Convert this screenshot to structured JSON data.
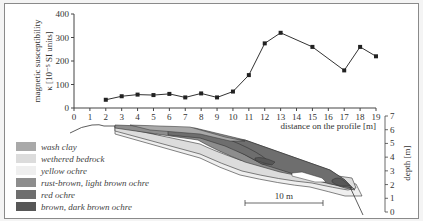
{
  "chart_data": {
    "type": "line",
    "title": "",
    "xlabel": "distance on the profile [m]",
    "ylabel": "magnetic susceptibility κ [10⁻⁵ SI units]",
    "ylabel_line1": "magnetic susceptibility",
    "ylabel_line2": "κ [10⁻⁵ SI units]",
    "xlim": [
      0,
      19
    ],
    "ylim": [
      0,
      400
    ],
    "x_ticks": [
      "0",
      "1",
      "2",
      "3",
      "4",
      "5",
      "6",
      "7",
      "8",
      "9",
      "10",
      "11",
      "12",
      "13",
      "14",
      "15",
      "16",
      "17",
      "18",
      "19"
    ],
    "y_ticks": [
      "0",
      "100",
      "200",
      "300",
      "400"
    ],
    "grid": false,
    "series": [
      {
        "name": "magnetic susceptibility",
        "x": [
          2,
          3,
          4,
          5,
          6,
          7,
          8,
          9,
          10,
          11,
          12,
          13,
          15,
          17,
          18,
          19
        ],
        "values": [
          35,
          50,
          57,
          55,
          60,
          45,
          62,
          45,
          70,
          140,
          275,
          320,
          260,
          160,
          260,
          220
        ]
      }
    ]
  },
  "cross_section": {
    "depth_label": "depth [m]",
    "depth_ticks": [
      "0",
      "1",
      "2",
      "3",
      "4",
      "5",
      "6",
      "7"
    ],
    "scale_bar_label": "10 m"
  },
  "legend": {
    "items": [
      {
        "label": "wash clay",
        "color": "#a9a9a9"
      },
      {
        "label": "wethered bedrock",
        "color": "#dcdcdc"
      },
      {
        "label": "yellow ochre",
        "color": "#efefef"
      },
      {
        "label": "rust-brown, light brown ochre",
        "color": "#8d8d8d"
      },
      {
        "label": "red ochre",
        "color": "#6e6e6e"
      },
      {
        "label": "brown, dark brown ochre",
        "color": "#575757"
      }
    ]
  }
}
